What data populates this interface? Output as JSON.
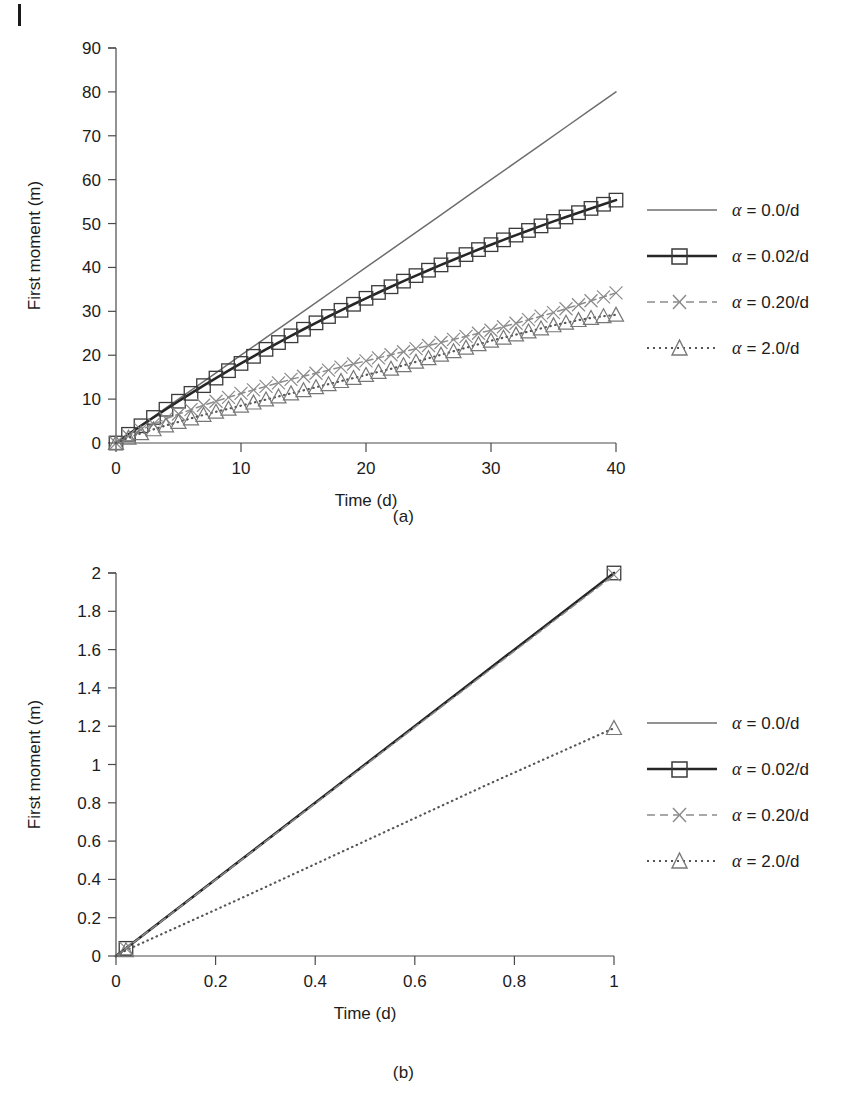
{
  "page": {
    "width": 863,
    "height": 1109,
    "background": "#ffffff",
    "scan_artifact": "vertical-tick-mark-top-left"
  },
  "figures": [
    {
      "id": "a",
      "caption": "(a)",
      "legend_position": "right"
    },
    {
      "id": "b",
      "caption": "(b)",
      "legend_position": "right"
    }
  ],
  "legend": {
    "entries": [
      {
        "label": "α = 0.0/d",
        "alpha": "α",
        "rest": " = 0.0/d",
        "style": "solid-thin",
        "marker": "none",
        "color": "#6e6e6e"
      },
      {
        "label": "α = 0.02/d",
        "alpha": "α",
        "rest": " = 0.02/d",
        "style": "solid-thick",
        "marker": "square",
        "color": "#262626"
      },
      {
        "label": "α = 0.20/d",
        "alpha": "α",
        "rest": " = 0.20/d",
        "style": "dashed",
        "marker": "cross",
        "color": "#8c8c8c"
      },
      {
        "label": "α = 2.0/d",
        "alpha": "α",
        "rest": " = 2.0/d",
        "style": "dotted",
        "marker": "triangle",
        "color": "#555555"
      }
    ]
  },
  "chart_data": [
    {
      "id": "a",
      "type": "line",
      "title": "",
      "xlabel": "Time (d)",
      "ylabel": "First moment (m)",
      "xlim": [
        0,
        40
      ],
      "ylim": [
        0,
        90
      ],
      "xticks": [
        0,
        10,
        20,
        30,
        40
      ],
      "yticks": [
        0,
        10,
        20,
        30,
        40,
        50,
        60,
        70,
        80,
        90
      ],
      "xtick_labels": [
        "0",
        "10",
        "20",
        "30",
        "40"
      ],
      "ytick_labels": [
        "0",
        "10",
        "20",
        "30",
        "40",
        "50",
        "60",
        "70",
        "80",
        "90"
      ],
      "grid": false,
      "legend_position": "right",
      "series": [
        {
          "name": "α = 0.0/d",
          "style": "solid-thin",
          "marker": "none",
          "color": "#6e6e6e",
          "x": [
            0,
            2,
            4,
            6,
            8,
            10,
            12,
            14,
            16,
            18,
            20,
            22,
            24,
            26,
            28,
            30,
            32,
            34,
            36,
            38,
            40
          ],
          "y": [
            0,
            4,
            8,
            12,
            16,
            20,
            24,
            28,
            32,
            36,
            40,
            44,
            48,
            52,
            56,
            60,
            64,
            68,
            72,
            76,
            80
          ]
        },
        {
          "name": "α = 0.02/d",
          "style": "solid-thick",
          "marker": "square",
          "color": "#262626",
          "x": [
            0,
            1,
            2,
            3,
            4,
            5,
            6,
            7,
            8,
            9,
            10,
            11,
            12,
            13,
            14,
            15,
            16,
            17,
            18,
            19,
            20,
            21,
            22,
            23,
            24,
            25,
            26,
            27,
            28,
            29,
            30,
            31,
            32,
            33,
            34,
            35,
            36,
            37,
            38,
            39,
            40
          ],
          "y": [
            0,
            1.98,
            3.92,
            5.82,
            7.69,
            9.52,
            11.31,
            13.07,
            14.79,
            16.48,
            18.13,
            19.75,
            21.34,
            22.89,
            24.42,
            25.92,
            27.38,
            28.82,
            30.23,
            31.61,
            32.97,
            34.3,
            35.6,
            36.88,
            38.14,
            39.37,
            40.58,
            41.76,
            42.93,
            44.07,
            45.19,
            46.29,
            47.37,
            48.43,
            49.47,
            50.49,
            51.5,
            52.48,
            53.45,
            54.4,
            55.34
          ]
        },
        {
          "name": "α = 0.20/d",
          "style": "dashed",
          "marker": "cross",
          "color": "#8c8c8c",
          "x": [
            0,
            1,
            2,
            3,
            4,
            5,
            6,
            7,
            8,
            9,
            10,
            11,
            12,
            13,
            14,
            15,
            16,
            17,
            18,
            19,
            20,
            21,
            22,
            23,
            24,
            25,
            26,
            27,
            28,
            29,
            30,
            31,
            32,
            33,
            34,
            35,
            36,
            37,
            38,
            39,
            40
          ],
          "y": [
            0,
            1.6,
            3.0,
            4.3,
            5.5,
            6.6,
            7.6,
            8.6,
            9.5,
            10.4,
            11.3,
            12.1,
            12.9,
            13.7,
            14.5,
            15.2,
            15.9,
            16.6,
            17.3,
            18.0,
            18.7,
            19.4,
            20.1,
            20.8,
            21.5,
            22.2,
            22.9,
            23.6,
            24.3,
            25.0,
            25.7,
            26.5,
            27.3,
            28.1,
            28.9,
            29.7,
            30.6,
            31.5,
            32.4,
            33.3,
            34.2
          ]
        },
        {
          "name": "α = 2.0/d",
          "style": "dotted",
          "marker": "triangle",
          "color": "#555555",
          "x": [
            0,
            1,
            2,
            3,
            4,
            5,
            6,
            7,
            8,
            9,
            10,
            11,
            12,
            13,
            14,
            15,
            16,
            17,
            18,
            19,
            20,
            21,
            22,
            23,
            24,
            25,
            26,
            27,
            28,
            29,
            30,
            31,
            32,
            33,
            34,
            35,
            36,
            37,
            38,
            39,
            40
          ],
          "y": [
            0,
            1.2,
            2.2,
            3.1,
            4.0,
            4.8,
            5.6,
            6.4,
            7.1,
            7.8,
            8.5,
            9.2,
            9.9,
            10.6,
            11.3,
            12.0,
            12.7,
            13.4,
            14.1,
            14.8,
            15.5,
            16.2,
            16.9,
            17.7,
            18.5,
            19.3,
            20.1,
            20.9,
            21.7,
            22.5,
            23.3,
            24.0,
            24.7,
            25.4,
            26.1,
            26.8,
            27.4,
            28.0,
            28.5,
            28.9,
            29.2
          ]
        }
      ],
      "annotations": []
    },
    {
      "id": "b",
      "type": "line",
      "title": "",
      "xlabel": "Time (d)",
      "ylabel": "First moment (m)",
      "xlim": [
        0,
        1
      ],
      "ylim": [
        0,
        2
      ],
      "xticks": [
        0,
        0.2,
        0.4,
        0.6,
        0.8,
        1
      ],
      "yticks": [
        0,
        0.2,
        0.4,
        0.6,
        0.8,
        1,
        1.2,
        1.4,
        1.6,
        1.8,
        2
      ],
      "xtick_labels": [
        "0",
        "0.2",
        "0.4",
        "0.6",
        "0.8",
        "1"
      ],
      "ytick_labels": [
        "0",
        "0.2",
        "0.4",
        "0.6",
        "0.8",
        "1",
        "1.2",
        "1.4",
        "1.6",
        "1.8",
        "2"
      ],
      "grid": false,
      "legend_position": "right",
      "series": [
        {
          "name": "α = 0.0/d",
          "style": "solid-thin",
          "marker": "none",
          "color": "#6e6e6e",
          "x": [
            0,
            0.25,
            0.5,
            0.75,
            1
          ],
          "y": [
            0,
            0.5,
            1.0,
            1.5,
            2.0
          ]
        },
        {
          "name": "α = 0.02/d",
          "style": "solid-thick",
          "marker": "square",
          "color": "#262626",
          "x": [
            0,
            0.02,
            1
          ],
          "y": [
            0,
            0.04,
            2.0
          ]
        },
        {
          "name": "α = 0.20/d",
          "style": "dashed",
          "marker": "cross",
          "color": "#8c8c8c",
          "x": [
            0,
            0.02,
            1
          ],
          "y": [
            0,
            0.04,
            1.99
          ]
        },
        {
          "name": "α = 2.0/d",
          "style": "dotted",
          "marker": "triangle",
          "color": "#555555",
          "x": [
            0,
            0.02,
            0.25,
            0.5,
            0.75,
            1
          ],
          "y": [
            0,
            0.03,
            0.3,
            0.6,
            0.9,
            1.19
          ]
        }
      ],
      "annotations": []
    }
  ]
}
